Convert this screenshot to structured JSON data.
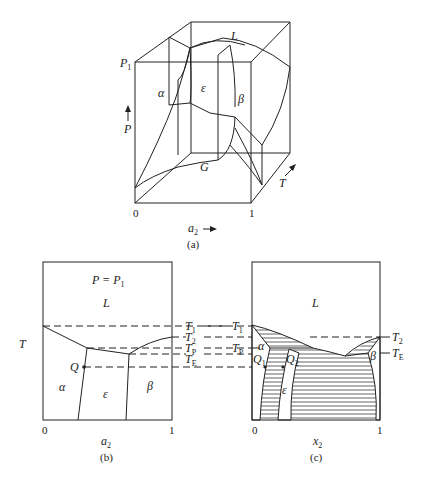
{
  "figure_a": {
    "caption": "(a)",
    "labels": {
      "L": "L",
      "alpha": "α",
      "epsilon": "ε",
      "beta": "β",
      "G": "G",
      "P": "P",
      "P1": "P",
      "P1_sub": "1",
      "T": "T",
      "x0": "0",
      "x1": "1",
      "a2": "a",
      "a2_sub": "2"
    }
  },
  "figure_b": {
    "caption": "(b)",
    "title": "P = P",
    "title_sub": "1",
    "labels": {
      "L": "L",
      "alpha": "α",
      "epsilon": "ε",
      "beta": "β",
      "Q": "Q",
      "T": "T",
      "x0": "0",
      "x1": "1",
      "a2": "a",
      "a2_sub": "2"
    },
    "temperature_lines": [
      {
        "name": "T",
        "sub": "1"
      },
      {
        "name": "T",
        "sub": "2"
      },
      {
        "name": "T",
        "sub": "P"
      },
      {
        "name": "T",
        "sub": "E"
      }
    ]
  },
  "figure_c": {
    "caption": "(c)",
    "labels": {
      "L": "L",
      "alpha": "α",
      "epsilon": "ε",
      "beta": "β",
      "Q1": "Q",
      "Q1_sub": "1",
      "Q2": "Q",
      "Q2_sub": "2",
      "x0": "0",
      "x1": "1",
      "x2": "x",
      "x2_sub": "2"
    },
    "temperature_labels": [
      {
        "name": "T",
        "sub": "1"
      },
      {
        "name": "T",
        "sub": "P"
      },
      {
        "name": "T",
        "sub": "2"
      },
      {
        "name": "T",
        "sub": "E"
      }
    ]
  }
}
